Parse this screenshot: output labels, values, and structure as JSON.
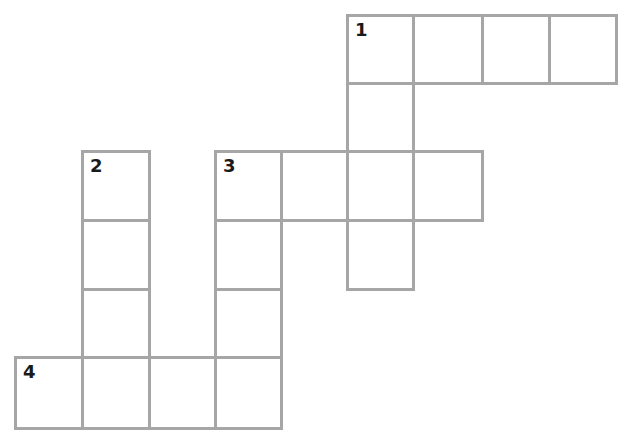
{
  "puzzle": {
    "type": "crossword",
    "border_color": "#a6a6a6",
    "number_color": "#1a1a1a",
    "col_edges": [
      15,
      82,
      149,
      215,
      281,
      347,
      413,
      482,
      549,
      616
    ],
    "row_edges": [
      15,
      83,
      151,
      220,
      289,
      357,
      428
    ],
    "cells": [
      {
        "row": 0,
        "col": 5,
        "number": "1"
      },
      {
        "row": 0,
        "col": 6
      },
      {
        "row": 0,
        "col": 7
      },
      {
        "row": 0,
        "col": 8
      },
      {
        "row": 1,
        "col": 5
      },
      {
        "row": 2,
        "col": 1,
        "number": "2"
      },
      {
        "row": 2,
        "col": 3,
        "number": "3"
      },
      {
        "row": 2,
        "col": 4
      },
      {
        "row": 2,
        "col": 5
      },
      {
        "row": 2,
        "col": 6
      },
      {
        "row": 3,
        "col": 1
      },
      {
        "row": 3,
        "col": 3
      },
      {
        "row": 3,
        "col": 5
      },
      {
        "row": 4,
        "col": 1
      },
      {
        "row": 4,
        "col": 3
      },
      {
        "row": 5,
        "col": 0,
        "number": "4"
      },
      {
        "row": 5,
        "col": 1
      },
      {
        "row": 5,
        "col": 2
      },
      {
        "row": 5,
        "col": 3
      }
    ],
    "entries": [
      {
        "number": "1",
        "direction": "across",
        "length": 4
      },
      {
        "number": "1",
        "direction": "down",
        "length": 4
      },
      {
        "number": "2",
        "direction": "down",
        "length": 4
      },
      {
        "number": "3",
        "direction": "across",
        "length": 4
      },
      {
        "number": "3",
        "direction": "down",
        "length": 4
      },
      {
        "number": "4",
        "direction": "across",
        "length": 4
      }
    ]
  }
}
